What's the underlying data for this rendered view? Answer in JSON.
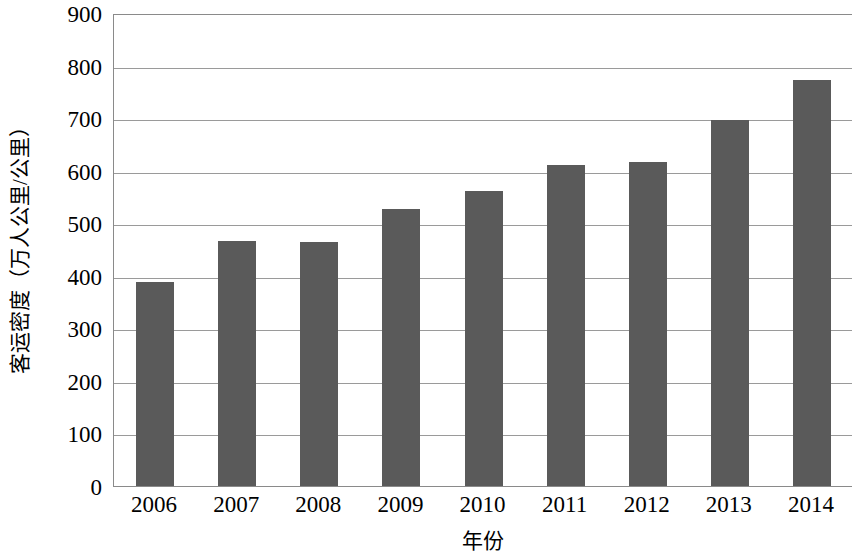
{
  "chart_data": {
    "type": "bar",
    "title": "",
    "xlabel": "年份",
    "ylabel": "客运密度（万人公里/公里）",
    "categories": [
      "2006",
      "2007",
      "2008",
      "2009",
      "2010",
      "2011",
      "2012",
      "2013",
      "2014"
    ],
    "values": [
      389,
      466,
      464,
      528,
      561,
      610,
      616,
      696,
      773
    ],
    "ylim": [
      0,
      900
    ],
    "ytick_labels": [
      "900",
      "800",
      "700",
      "600",
      "500",
      "400",
      "300",
      "200",
      "100",
      "0"
    ],
    "ytick_values": [
      900,
      800,
      700,
      600,
      500,
      400,
      300,
      200,
      100,
      0
    ],
    "ytick_step": 100,
    "grid": true,
    "legend": "none",
    "bar_color": "#5a5a5a",
    "axis_color": "#8a8a8a",
    "grid_color": "#9a9a9a",
    "background_color": "#ffffff",
    "series": [
      {
        "name": "客运密度",
        "values": [
          389,
          466,
          464,
          528,
          561,
          610,
          616,
          696,
          773
        ]
      }
    ]
  }
}
